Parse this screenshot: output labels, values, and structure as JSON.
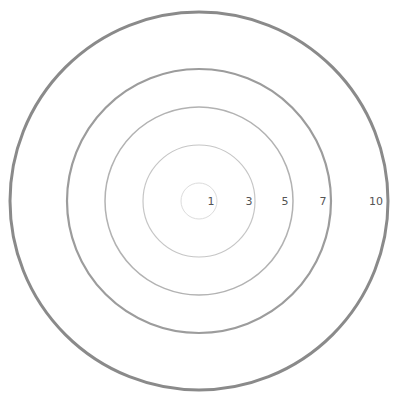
{
  "diagram": {
    "type": "concentric-circles",
    "center": {
      "x": 199,
      "y": 201
    },
    "rings": [
      {
        "label": "1",
        "radius": 18,
        "stroke": "#dcdcdc",
        "width": 1,
        "label_x": 211
      },
      {
        "label": "3",
        "radius": 56,
        "stroke": "#c6c6c6",
        "width": 1.2,
        "label_x": 249
      },
      {
        "label": "5",
        "radius": 94,
        "stroke": "#b2b2b2",
        "width": 1.5,
        "label_x": 285
      },
      {
        "label": "7",
        "radius": 132,
        "stroke": "#9c9c9c",
        "width": 2.2,
        "label_x": 323
      },
      {
        "label": "10",
        "radius": 189,
        "stroke": "#8a8a8a",
        "width": 3,
        "label_x": 376
      }
    ],
    "labels": {
      "r1": "1",
      "r3": "3",
      "r5": "5",
      "r7": "7",
      "r10": "10"
    }
  }
}
